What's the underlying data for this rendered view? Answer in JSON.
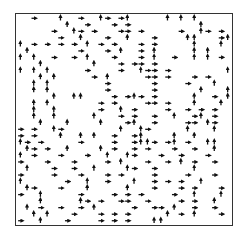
{
  "chart_data": {
    "type": "quiver",
    "title": "",
    "xlabel": "",
    "ylabel": "",
    "grid": false,
    "legend": null,
    "grid_size": [
      32,
      32
    ],
    "frame": {
      "left": 15,
      "top": 13,
      "width": 218,
      "height": 213
    },
    "arrow_color": "#111111",
    "directions": {
      "r": "right",
      "u": "up"
    },
    "arrows": [
      [
        2,
        0,
        "r"
      ],
      [
        6,
        0,
        "u"
      ],
      [
        9,
        0,
        "r"
      ],
      [
        12,
        0,
        "u"
      ],
      [
        13,
        0,
        "r"
      ],
      [
        15,
        0,
        "r"
      ],
      [
        16,
        0,
        "u"
      ],
      [
        22,
        0,
        "u"
      ],
      [
        24,
        0,
        "u"
      ],
      [
        26,
        0,
        "u"
      ],
      [
        7,
        1,
        "u"
      ],
      [
        10,
        1,
        "r"
      ],
      [
        14,
        1,
        "r"
      ],
      [
        16,
        1,
        "r"
      ],
      [
        27,
        1,
        "u"
      ],
      [
        5,
        2,
        "r"
      ],
      [
        8,
        2,
        "u"
      ],
      [
        9,
        2,
        "r"
      ],
      [
        11,
        2,
        "r"
      ],
      [
        15,
        2,
        "r"
      ],
      [
        16,
        2,
        "r"
      ],
      [
        18,
        2,
        "r"
      ],
      [
        24,
        2,
        "r"
      ],
      [
        27,
        2,
        "u"
      ],
      [
        28,
        2,
        "r"
      ],
      [
        30,
        2,
        "r"
      ],
      [
        6,
        3,
        "r"
      ],
      [
        9,
        3,
        "u"
      ],
      [
        13,
        3,
        "r"
      ],
      [
        16,
        3,
        "u"
      ],
      [
        20,
        3,
        "r"
      ],
      [
        25,
        3,
        "u"
      ],
      [
        26,
        3,
        "u"
      ],
      [
        30,
        3,
        "r"
      ],
      [
        31,
        3,
        "u"
      ],
      [
        0,
        4,
        "u"
      ],
      [
        2,
        4,
        "r"
      ],
      [
        4,
        4,
        "r"
      ],
      [
        6,
        4,
        "r"
      ],
      [
        8,
        4,
        "r"
      ],
      [
        10,
        4,
        "u"
      ],
      [
        12,
        4,
        "r"
      ],
      [
        14,
        4,
        "r"
      ],
      [
        18,
        4,
        "r"
      ],
      [
        20,
        4,
        "r"
      ],
      [
        26,
        4,
        "u"
      ],
      [
        30,
        4,
        "u"
      ],
      [
        1,
        5,
        "u"
      ],
      [
        9,
        5,
        "r"
      ],
      [
        13,
        5,
        "r"
      ],
      [
        15,
        5,
        "u"
      ],
      [
        18,
        5,
        "r"
      ],
      [
        20,
        5,
        "u"
      ],
      [
        26,
        5,
        "u"
      ],
      [
        28,
        5,
        "u"
      ],
      [
        0,
        6,
        "u"
      ],
      [
        2,
        6,
        "u"
      ],
      [
        5,
        6,
        "r"
      ],
      [
        8,
        6,
        "r"
      ],
      [
        10,
        6,
        "u"
      ],
      [
        14,
        6,
        "r"
      ],
      [
        18,
        6,
        "r"
      ],
      [
        20,
        6,
        "u"
      ],
      [
        23,
        6,
        "r"
      ],
      [
        26,
        6,
        "u"
      ],
      [
        28,
        6,
        "u"
      ],
      [
        30,
        6,
        "r"
      ],
      [
        3,
        7,
        "u"
      ],
      [
        11,
        7,
        "u"
      ],
      [
        15,
        7,
        "r"
      ],
      [
        17,
        7,
        "r"
      ],
      [
        18,
        7,
        "r"
      ],
      [
        20,
        7,
        "r"
      ],
      [
        0,
        8,
        "u"
      ],
      [
        2,
        8,
        "u"
      ],
      [
        4,
        8,
        "u"
      ],
      [
        10,
        8,
        "r"
      ],
      [
        15,
        8,
        "r"
      ],
      [
        18,
        8,
        "u"
      ],
      [
        19,
        8,
        "r"
      ],
      [
        20,
        8,
        "r"
      ],
      [
        22,
        8,
        "r"
      ],
      [
        31,
        8,
        "u"
      ],
      [
        3,
        9,
        "u"
      ],
      [
        5,
        9,
        "u"
      ],
      [
        11,
        9,
        "r"
      ],
      [
        13,
        9,
        "u"
      ],
      [
        19,
        9,
        "r"
      ],
      [
        20,
        9,
        "r"
      ],
      [
        22,
        9,
        "r"
      ],
      [
        26,
        9,
        "r"
      ],
      [
        28,
        9,
        "r"
      ],
      [
        2,
        10,
        "u"
      ],
      [
        4,
        10,
        "u"
      ],
      [
        13,
        10,
        "r"
      ],
      [
        20,
        10,
        "r"
      ],
      [
        25,
        10,
        "r"
      ],
      [
        29,
        10,
        "u"
      ],
      [
        2,
        11,
        "u"
      ],
      [
        4,
        11,
        "u"
      ],
      [
        13,
        11,
        "r"
      ],
      [
        20,
        11,
        "r"
      ],
      [
        27,
        11,
        "u"
      ],
      [
        31,
        11,
        "u"
      ],
      [
        5,
        12,
        "u"
      ],
      [
        8,
        12,
        "u"
      ],
      [
        9,
        12,
        "u"
      ],
      [
        14,
        12,
        "r"
      ],
      [
        16,
        12,
        "r"
      ],
      [
        17,
        12,
        "u"
      ],
      [
        18,
        12,
        "r"
      ],
      [
        20,
        12,
        "r"
      ],
      [
        26,
        12,
        "u"
      ],
      [
        29,
        12,
        "r"
      ],
      [
        31,
        12,
        "u"
      ],
      [
        2,
        13,
        "u"
      ],
      [
        4,
        13,
        "u"
      ],
      [
        12,
        13,
        "r"
      ],
      [
        14,
        13,
        "r"
      ],
      [
        19,
        13,
        "r"
      ],
      [
        20,
        13,
        "r"
      ],
      [
        22,
        13,
        "r"
      ],
      [
        26,
        13,
        "u"
      ],
      [
        30,
        13,
        "u"
      ],
      [
        2,
        14,
        "u"
      ],
      [
        5,
        14,
        "u"
      ],
      [
        12,
        14,
        "r"
      ],
      [
        15,
        14,
        "u"
      ],
      [
        17,
        14,
        "r"
      ],
      [
        22,
        14,
        "r"
      ],
      [
        25,
        14,
        "r"
      ],
      [
        27,
        14,
        "r"
      ],
      [
        29,
        14,
        "r"
      ],
      [
        2,
        15,
        "u"
      ],
      [
        5,
        15,
        "u"
      ],
      [
        11,
        15,
        "u"
      ],
      [
        15,
        15,
        "r"
      ],
      [
        17,
        15,
        "r"
      ],
      [
        20,
        15,
        "r"
      ],
      [
        23,
        15,
        "u"
      ],
      [
        26,
        15,
        "r"
      ],
      [
        27,
        15,
        "u"
      ],
      [
        29,
        15,
        "r"
      ],
      [
        3,
        16,
        "u"
      ],
      [
        7,
        16,
        "u"
      ],
      [
        12,
        16,
        "u"
      ],
      [
        16,
        16,
        "r"
      ],
      [
        17,
        16,
        "u"
      ],
      [
        20,
        16,
        "r"
      ],
      [
        25,
        16,
        "r"
      ],
      [
        26,
        16,
        "r"
      ],
      [
        28,
        16,
        "u"
      ],
      [
        29,
        16,
        "r"
      ],
      [
        0,
        17,
        "r"
      ],
      [
        2,
        17,
        "r"
      ],
      [
        5,
        17,
        "u"
      ],
      [
        6,
        17,
        "r"
      ],
      [
        15,
        17,
        "u"
      ],
      [
        18,
        17,
        "u"
      ],
      [
        19,
        17,
        "r"
      ],
      [
        25,
        17,
        "u"
      ],
      [
        29,
        17,
        "u"
      ],
      [
        0,
        18,
        "r"
      ],
      [
        2,
        18,
        "r"
      ],
      [
        6,
        18,
        "u"
      ],
      [
        9,
        18,
        "u"
      ],
      [
        11,
        18,
        "u"
      ],
      [
        14,
        18,
        "r"
      ],
      [
        17,
        18,
        "r"
      ],
      [
        18,
        18,
        "u"
      ],
      [
        23,
        18,
        "u"
      ],
      [
        26,
        18,
        "u"
      ],
      [
        0,
        19,
        "u"
      ],
      [
        1,
        19,
        "r"
      ],
      [
        3,
        19,
        "r"
      ],
      [
        9,
        19,
        "r"
      ],
      [
        14,
        19,
        "r"
      ],
      [
        17,
        19,
        "r"
      ],
      [
        18,
        19,
        "u"
      ],
      [
        19,
        19,
        "u"
      ],
      [
        20,
        19,
        "r"
      ],
      [
        22,
        19,
        "r"
      ],
      [
        23,
        19,
        "u"
      ],
      [
        25,
        19,
        "r"
      ],
      [
        28,
        19,
        "u"
      ],
      [
        29,
        19,
        "u"
      ],
      [
        1,
        20,
        "u"
      ],
      [
        2,
        20,
        "r"
      ],
      [
        4,
        20,
        "r"
      ],
      [
        7,
        20,
        "u"
      ],
      [
        12,
        20,
        "u"
      ],
      [
        14,
        20,
        "r"
      ],
      [
        17,
        20,
        "r"
      ],
      [
        19,
        20,
        "r"
      ],
      [
        23,
        20,
        "r"
      ],
      [
        26,
        20,
        "r"
      ],
      [
        29,
        20,
        "u"
      ],
      [
        0,
        21,
        "u"
      ],
      [
        2,
        21,
        "r"
      ],
      [
        6,
        21,
        "r"
      ],
      [
        10,
        21,
        "r"
      ],
      [
        13,
        21,
        "u"
      ],
      [
        16,
        21,
        "u"
      ],
      [
        17,
        21,
        "r"
      ],
      [
        21,
        21,
        "r"
      ],
      [
        24,
        21,
        "r"
      ],
      [
        28,
        21,
        "r"
      ],
      [
        0,
        22,
        "r"
      ],
      [
        4,
        22,
        "r"
      ],
      [
        8,
        22,
        "r"
      ],
      [
        13,
        22,
        "r"
      ],
      [
        15,
        22,
        "u"
      ],
      [
        19,
        22,
        "r"
      ],
      [
        22,
        22,
        "r"
      ],
      [
        24,
        22,
        "u"
      ],
      [
        26,
        22,
        "r"
      ],
      [
        29,
        22,
        "r"
      ],
      [
        1,
        23,
        "u"
      ],
      [
        5,
        23,
        "r"
      ],
      [
        8,
        23,
        "r"
      ],
      [
        11,
        23,
        "u"
      ],
      [
        16,
        23,
        "u"
      ],
      [
        17,
        23,
        "r"
      ],
      [
        20,
        23,
        "r"
      ],
      [
        26,
        23,
        "u"
      ],
      [
        0,
        24,
        "r"
      ],
      [
        5,
        24,
        "r"
      ],
      [
        9,
        24,
        "r"
      ],
      [
        13,
        24,
        "r"
      ],
      [
        15,
        24,
        "r"
      ],
      [
        20,
        24,
        "r"
      ],
      [
        25,
        24,
        "r"
      ],
      [
        29,
        24,
        "r"
      ],
      [
        0,
        25,
        "u"
      ],
      [
        7,
        25,
        "r"
      ],
      [
        10,
        25,
        "u"
      ],
      [
        13,
        25,
        "r"
      ],
      [
        17,
        25,
        "u"
      ],
      [
        20,
        25,
        "r"
      ],
      [
        22,
        25,
        "r"
      ],
      [
        24,
        25,
        "r"
      ],
      [
        27,
        25,
        "u"
      ],
      [
        1,
        26,
        "u"
      ],
      [
        2,
        26,
        "r"
      ],
      [
        6,
        26,
        "r"
      ],
      [
        10,
        26,
        "u"
      ],
      [
        16,
        26,
        "u"
      ],
      [
        20,
        26,
        "r"
      ],
      [
        24,
        26,
        "r"
      ],
      [
        26,
        26,
        "r"
      ],
      [
        30,
        26,
        "r"
      ],
      [
        0,
        27,
        "r"
      ],
      [
        3,
        27,
        "u"
      ],
      [
        9,
        27,
        "r"
      ],
      [
        14,
        27,
        "r"
      ],
      [
        16,
        27,
        "r"
      ],
      [
        18,
        27,
        "r"
      ],
      [
        23,
        27,
        "r"
      ],
      [
        26,
        27,
        "u"
      ],
      [
        30,
        27,
        "u"
      ],
      [
        3,
        28,
        "u"
      ],
      [
        9,
        28,
        "u"
      ],
      [
        10,
        28,
        "r"
      ],
      [
        12,
        28,
        "r"
      ],
      [
        15,
        28,
        "r"
      ],
      [
        16,
        28,
        "r"
      ],
      [
        19,
        28,
        "r"
      ],
      [
        24,
        28,
        "r"
      ],
      [
        26,
        28,
        "r"
      ],
      [
        29,
        28,
        "u"
      ],
      [
        1,
        29,
        "u"
      ],
      [
        3,
        29,
        "r"
      ],
      [
        6,
        29,
        "r"
      ],
      [
        9,
        29,
        "r"
      ],
      [
        11,
        29,
        "u"
      ],
      [
        17,
        29,
        "r"
      ],
      [
        20,
        29,
        "r"
      ],
      [
        21,
        29,
        "r"
      ],
      [
        23,
        29,
        "u"
      ],
      [
        26,
        29,
        "r"
      ],
      [
        29,
        29,
        "r"
      ],
      [
        2,
        30,
        "u"
      ],
      [
        4,
        30,
        "u"
      ],
      [
        8,
        30,
        "r"
      ],
      [
        12,
        30,
        "r"
      ],
      [
        14,
        30,
        "r"
      ],
      [
        16,
        30,
        "r"
      ],
      [
        22,
        30,
        "u"
      ],
      [
        24,
        30,
        "r"
      ],
      [
        26,
        30,
        "u"
      ],
      [
        30,
        30,
        "r"
      ],
      [
        0,
        31,
        "r"
      ],
      [
        3,
        31,
        "u"
      ],
      [
        7,
        31,
        "r"
      ],
      [
        12,
        31,
        "r"
      ],
      [
        14,
        31,
        "r"
      ],
      [
        16,
        31,
        "r"
      ],
      [
        20,
        31,
        "u"
      ],
      [
        21,
        31,
        "u"
      ]
    ]
  }
}
